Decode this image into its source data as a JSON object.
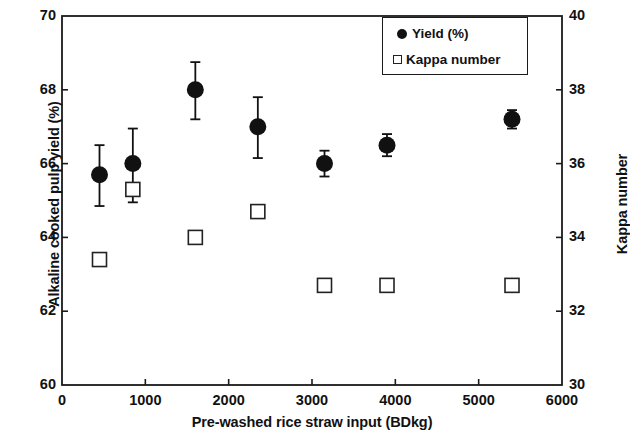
{
  "chart_data": {
    "type": "scatter",
    "title": "",
    "xlabel": "Pre-washed rice straw input (BDkg)",
    "ylabel": "Alkaline cooked pulp yield (%)",
    "y2label": "Kappa number",
    "xlim": [
      0,
      6000
    ],
    "ylim": [
      60,
      70
    ],
    "y2lim": [
      30,
      40
    ],
    "xticks": [
      0,
      1000,
      2000,
      3000,
      4000,
      5000,
      6000
    ],
    "yticks": [
      60,
      62,
      64,
      66,
      68,
      70
    ],
    "y2ticks": [
      30,
      32,
      34,
      36,
      38,
      40
    ],
    "xtick_labels": [
      "0",
      "1000",
      "2000",
      "3000",
      "4000",
      "5000",
      "6000"
    ],
    "ytick_labels": [
      "60",
      "62",
      "64",
      "66",
      "68",
      "70"
    ],
    "y2tick_labels": [
      "30",
      "32",
      "34",
      "36",
      "38",
      "40"
    ],
    "grid": false,
    "legend_position": "upper right",
    "x": [
      450,
      850,
      1600,
      2350,
      3150,
      3900,
      5400
    ],
    "series": [
      {
        "name": "Yield (%)",
        "axis": "left",
        "marker": "filled-circle",
        "color": "#111111",
        "values": [
          65.7,
          66.0,
          68.0,
          67.0,
          66.0,
          66.5,
          67.2
        ],
        "error_low": [
          0.85,
          1.05,
          0.8,
          0.85,
          0.35,
          0.3,
          0.25
        ],
        "error_high": [
          0.8,
          0.95,
          0.75,
          0.8,
          0.35,
          0.3,
          0.25
        ]
      },
      {
        "name": "Kappa number",
        "axis": "right",
        "marker": "open-square",
        "color": "#222222",
        "values": [
          33.4,
          35.3,
          34.0,
          34.7,
          32.7,
          32.7,
          32.7
        ]
      }
    ]
  },
  "legend": {
    "yield_label": "Yield (%)",
    "kappa_label": "Kappa number"
  }
}
